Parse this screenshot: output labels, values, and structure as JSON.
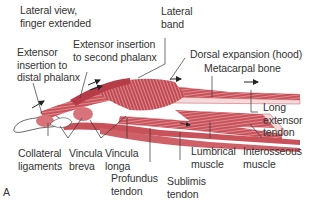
{
  "figure": {
    "panel_letter": "A",
    "view_caption": [
      "Lateral view,",
      "finger extended"
    ],
    "colors": {
      "muscle": "#c9525a",
      "muscle_light": "#e39aa0",
      "muscle_dark": "#a8323c",
      "tendon_pale": "#f2d3d5",
      "leader_line": "#333333",
      "text": "#333333",
      "background": "#ffffff"
    },
    "labels": {
      "lateral_band": [
        "Lateral",
        "band"
      ],
      "extensor_insertion_second": [
        "Extensor insertion",
        "to second phalanx"
      ],
      "extensor_insertion_distal": [
        "Extensor",
        "insertion to",
        "distal phalanx"
      ],
      "dorsal_expansion": [
        "Dorsal expansion (hood)"
      ],
      "metacarpal_bone": [
        "Metacarpal bone"
      ],
      "long_extensor_tendon": [
        "Long",
        "extensor",
        "tendon"
      ],
      "collateral_ligaments": [
        "Collateral",
        "ligaments"
      ],
      "vincula_breva": [
        "Vincula",
        "breva"
      ],
      "vincula_longa": [
        "Vincula",
        "longa"
      ],
      "profundus_tendon": [
        "Profundus",
        "tendon"
      ],
      "sublimis_tendon": [
        "Sublimis",
        "tendon"
      ],
      "lumbrical_muscle": [
        "Lumbrical",
        "muscle"
      ],
      "interosseous_muscle": [
        "Interosseous",
        "muscle"
      ]
    }
  }
}
